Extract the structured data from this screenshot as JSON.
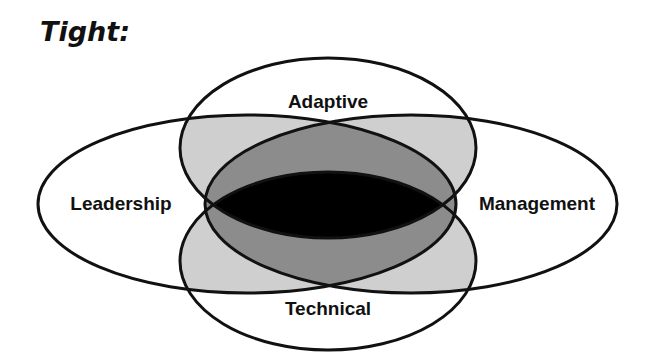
{
  "title": "Tight:",
  "diagram": {
    "type": "four-ellipse venn diagram",
    "sets": [
      {
        "name": "Adaptive",
        "position": "top"
      },
      {
        "name": "Leadership",
        "position": "left"
      },
      {
        "name": "Management",
        "position": "right"
      },
      {
        "name": "Technical",
        "position": "bottom"
      }
    ],
    "colors": {
      "outline": "#111111",
      "single": "#ffffff",
      "pairwise_overlap": "#cfcfcf",
      "leadership_management_overlap": "#8c8c8c",
      "all_overlap": "#000000"
    }
  }
}
